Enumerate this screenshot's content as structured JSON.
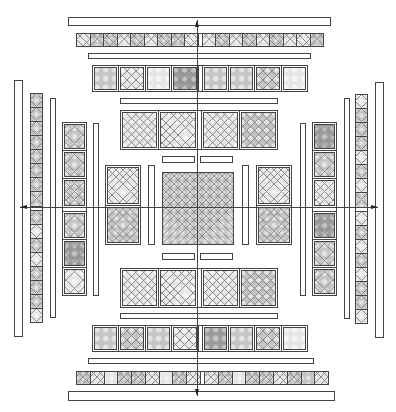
{
  "diagram": {
    "title": "",
    "colors": {
      "stroke": "#444444",
      "bar_fill": "#ffffff",
      "tile_light": "#e6e6e6",
      "tile_mid": "#c4c4c4",
      "tile_dark": "#9a9a9a",
      "grid_line": "#8a8a8a",
      "background": "#ffffff"
    },
    "arrows": [
      {
        "id": "arrow-up",
        "direction": "up",
        "from": [
          197,
          207
        ],
        "to": [
          197,
          20
        ]
      },
      {
        "id": "arrow-down",
        "direction": "down",
        "from": [
          197,
          207
        ],
        "to": [
          197,
          396
        ]
      },
      {
        "id": "arrow-left",
        "direction": "left",
        "from": [
          197,
          207
        ],
        "to": [
          20,
          207
        ]
      },
      {
        "id": "arrow-right",
        "direction": "right",
        "from": [
          197,
          207
        ],
        "to": [
          378,
          207
        ]
      }
    ],
    "bars": [
      {
        "id": "top-outer-bar",
        "x": 68,
        "y": 17,
        "w": 263,
        "h": 9
      },
      {
        "id": "top-thin-bar-1",
        "x": 88,
        "y": 53,
        "w": 223,
        "h": 6
      },
      {
        "id": "top-thin-bar-2",
        "x": 120,
        "y": 98,
        "w": 158,
        "h": 6
      },
      {
        "id": "top-inner-bar-left",
        "x": 162,
        "y": 156,
        "w": 33,
        "h": 7
      },
      {
        "id": "top-inner-bar-right",
        "x": 200,
        "y": 156,
        "w": 33,
        "h": 7
      },
      {
        "id": "bottom-outer-bar",
        "x": 68,
        "y": 391,
        "w": 267,
        "h": 10
      },
      {
        "id": "bottom-thin-bar-1",
        "x": 88,
        "y": 358,
        "w": 226,
        "h": 6
      },
      {
        "id": "bottom-thin-bar-2",
        "x": 120,
        "y": 313,
        "w": 158,
        "h": 6
      },
      {
        "id": "bottom-inner-bar-left",
        "x": 162,
        "y": 253,
        "w": 33,
        "h": 7
      },
      {
        "id": "bottom-inner-bar-right",
        "x": 200,
        "y": 253,
        "w": 33,
        "h": 7
      },
      {
        "id": "left-outer-bar",
        "x": 14,
        "y": 80,
        "w": 9,
        "h": 257
      },
      {
        "id": "left-thin-bar-1",
        "x": 50,
        "y": 98,
        "w": 6,
        "h": 220
      },
      {
        "id": "left-thin-bar-2",
        "x": 93,
        "y": 123,
        "w": 6,
        "h": 173
      },
      {
        "id": "left-inner-bar",
        "x": 148,
        "y": 165,
        "w": 7,
        "h": 80
      },
      {
        "id": "right-outer-bar",
        "x": 375,
        "y": 82,
        "w": 9,
        "h": 256
      },
      {
        "id": "right-thin-bar-1",
        "x": 344,
        "y": 98,
        "w": 6,
        "h": 221
      },
      {
        "id": "right-thin-bar-2",
        "x": 300,
        "y": 123,
        "w": 6,
        "h": 173
      },
      {
        "id": "right-inner-bar",
        "x": 242,
        "y": 165,
        "w": 7,
        "h": 80
      }
    ],
    "tile_groups": [
      {
        "id": "top-small-tiles",
        "orient": "row",
        "x": 76,
        "y": 33,
        "w": 248,
        "h": 14,
        "cells": 2,
        "tiles": [
          "light",
          "mid",
          "mid",
          "light",
          "mid",
          "light",
          "mid",
          "mid",
          "light",
          "gap",
          "light",
          "mid",
          "light",
          "mid",
          "light",
          "mid",
          "light",
          "light",
          "mid"
        ]
      },
      {
        "id": "top-medium-tiles",
        "orient": "row",
        "x": 92,
        "y": 65,
        "w": 216,
        "h": 27,
        "cells": 3,
        "thick": true,
        "tiles": [
          "mid",
          "light",
          "light",
          "dark",
          "gap",
          "mid",
          "mid",
          "mid",
          "light"
        ]
      },
      {
        "id": "top-large-tiles",
        "orient": "row",
        "x": 120,
        "y": 110,
        "w": 158,
        "h": 40,
        "cells": 5,
        "thick": true,
        "tiles": [
          "light",
          "light",
          "gap",
          "light",
          "mid"
        ]
      },
      {
        "id": "center-square",
        "orient": "row",
        "x": 162,
        "y": 172,
        "w": 72,
        "h": 73,
        "cells": 9,
        "tiles": [
          "mid"
        ]
      },
      {
        "id": "left-side-tiles",
        "orient": "col",
        "x": 105,
        "y": 165,
        "w": 36,
        "h": 80,
        "cells": 5,
        "thick": true,
        "tiles": [
          "light",
          "mid"
        ]
      },
      {
        "id": "right-side-tiles",
        "orient": "col",
        "x": 256,
        "y": 165,
        "w": 36,
        "h": 80,
        "cells": 5,
        "thick": true,
        "tiles": [
          "light",
          "mid"
        ]
      },
      {
        "id": "bottom-large-tiles",
        "orient": "row",
        "x": 120,
        "y": 268,
        "w": 158,
        "h": 40,
        "cells": 5,
        "thick": true,
        "tiles": [
          "light",
          "light",
          "gap",
          "light",
          "mid"
        ]
      },
      {
        "id": "bottom-medium-tiles",
        "orient": "row",
        "x": 92,
        "y": 325,
        "w": 216,
        "h": 27,
        "cells": 3,
        "thick": true,
        "tiles": [
          "mid",
          "mid",
          "mid",
          "light",
          "gap",
          "dark",
          "mid",
          "mid",
          "light"
        ]
      },
      {
        "id": "bottom-small-tiles",
        "orient": "row",
        "x": 76,
        "y": 371,
        "w": 253,
        "h": 14,
        "cells": 2,
        "tiles": [
          "mid",
          "light",
          "light",
          "mid",
          "mid",
          "light",
          "light",
          "mid",
          "light",
          "gap",
          "light",
          "mid",
          "light",
          "mid",
          "mid",
          "light",
          "mid",
          "mid",
          "light"
        ]
      },
      {
        "id": "left-medium-tiles",
        "orient": "col",
        "x": 62,
        "y": 122,
        "w": 25,
        "h": 174,
        "cells": 3,
        "thick": true,
        "tiles": [
          "mid",
          "mid",
          "mid",
          "gap",
          "mid",
          "dark",
          "light"
        ]
      },
      {
        "id": "left-small-tiles",
        "orient": "col",
        "x": 30,
        "y": 93,
        "w": 13,
        "h": 230,
        "cells": 2,
        "tiles": [
          "mid",
          "mid",
          "mid",
          "mid",
          "mid",
          "mid",
          "mid",
          "mid",
          "gap",
          "mid",
          "light",
          "mid",
          "light",
          "mid",
          "mid",
          "mid",
          "light"
        ]
      },
      {
        "id": "right-medium-tiles",
        "orient": "col",
        "x": 312,
        "y": 122,
        "w": 25,
        "h": 174,
        "cells": 3,
        "thick": true,
        "tiles": [
          "dark",
          "mid",
          "light",
          "gap",
          "dark",
          "mid",
          "mid"
        ]
      },
      {
        "id": "right-small-tiles",
        "orient": "col",
        "x": 355,
        "y": 94,
        "w": 13,
        "h": 230,
        "cells": 2,
        "tiles": [
          "light",
          "mid",
          "mid",
          "mid",
          "light",
          "mid",
          "light",
          "mid",
          "gap",
          "light",
          "mid",
          "light",
          "mid",
          "light",
          "mid",
          "mid",
          "light"
        ]
      }
    ]
  }
}
